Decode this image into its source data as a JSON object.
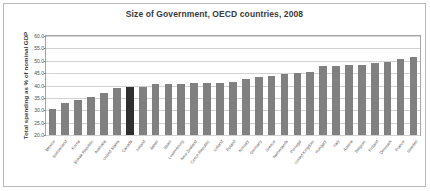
{
  "chart_data": {
    "type": "bar",
    "title": "Size of Government, OECD countries, 2008",
    "xlabel": "",
    "ylabel": "Total spending as % of nominal GDP",
    "ylim": [
      20.0,
      60.0
    ],
    "ytick_labels": [
      "60.0",
      "55.0",
      "50.0",
      "45.0",
      "40.0",
      "35.0",
      "30.0",
      "25.0",
      "20.0"
    ],
    "ytick_values": [
      60.0,
      55.0,
      50.0,
      45.0,
      40.0,
      35.0,
      30.0,
      25.0,
      20.0
    ],
    "grid": true,
    "legend": "none",
    "highlight_category": "Canada",
    "bar_color": "#808080",
    "highlight_color": "#303030",
    "categories": [
      "Mexico",
      "Switzerland",
      "Korea",
      "Slovak Republic",
      "Australia",
      "United States",
      "Canada",
      "Ireland",
      "Japan",
      "Spain",
      "Luxembourg",
      "New Zealand",
      "Czech Republic",
      "Iceland",
      "Poland",
      "Norway",
      "Germany",
      "Greece",
      "Netherlands",
      "Portugal",
      "United Kingdom",
      "Hungary",
      "Italy",
      "Austria",
      "Belgium",
      "Finland",
      "Denmark",
      "France",
      "Sweden"
    ],
    "values": [
      30.5,
      33.0,
      34.0,
      35.2,
      37.0,
      38.8,
      39.5,
      39.6,
      40.5,
      40.6,
      40.8,
      40.9,
      41.0,
      41.0,
      41.5,
      42.6,
      43.3,
      43.7,
      44.5,
      45.0,
      45.5,
      47.8,
      48.0,
      48.3,
      48.3,
      49.2,
      49.6,
      50.9,
      51.5
    ],
    "value_unit": "% of nominal GDP",
    "bar_count": 29
  }
}
